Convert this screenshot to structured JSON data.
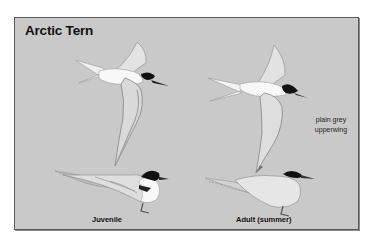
{
  "plate": {
    "title": "Arctic Tern",
    "annotation": "plain grey upperwing",
    "colors": {
      "background": "#c9c9c9",
      "frame": "#5a5a5a",
      "body_white": "#f6f6f6",
      "wing_grey": "#dcdcdc",
      "cap_black": "#111111"
    }
  },
  "figures": [
    {
      "id": "juvenile-flight",
      "pose": "flying"
    },
    {
      "id": "adult-flight",
      "pose": "flying"
    },
    {
      "id": "juvenile-perched",
      "pose": "standing",
      "label": "Juvenile"
    },
    {
      "id": "adult-perched",
      "pose": "standing",
      "label": "Adult (summer)"
    }
  ]
}
